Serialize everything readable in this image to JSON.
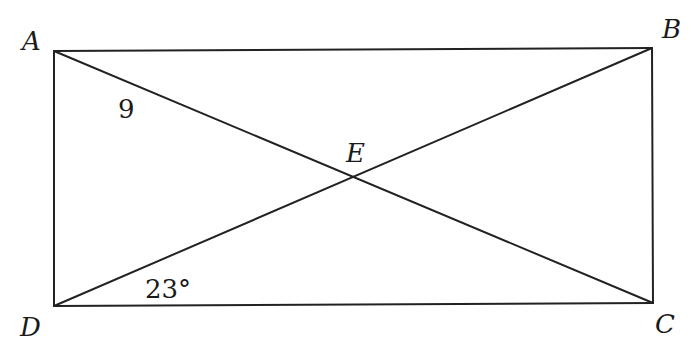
{
  "figure": {
    "type": "rectangle-with-diagonals",
    "line_color": "#222222",
    "points": [
      {
        "label": "A",
        "x": 54,
        "y": 51
      },
      {
        "label": "B",
        "x": 652,
        "y": 48
      },
      {
        "label": "C",
        "x": 653,
        "y": 303
      },
      {
        "label": "D",
        "x": 54,
        "y": 306
      },
      {
        "label": "E",
        "x": 352,
        "y": 176
      }
    ],
    "segments": [
      "AB",
      "BC",
      "CD",
      "DA",
      "AC",
      "BD"
    ],
    "annotations": {
      "segment_AE_length": "9",
      "angle_BDC": "23°"
    }
  }
}
